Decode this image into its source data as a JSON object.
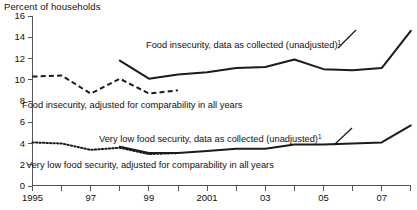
{
  "chart_data": {
    "type": "line",
    "title": "",
    "ylabel": "Percent of households",
    "xlabel": "",
    "ylim": [
      0,
      16
    ],
    "xlim": [
      1995,
      2008
    ],
    "y_ticks": [
      "0",
      "2",
      "4",
      "6",
      "8",
      "10",
      "12",
      "14",
      "16"
    ],
    "y_tick_values": [
      0,
      2,
      4,
      6,
      8,
      10,
      12,
      14,
      16
    ],
    "x_ticks": [
      1995,
      1996,
      1997,
      1998,
      1999,
      2000,
      2001,
      2002,
      2003,
      2004,
      2005,
      2006,
      2007,
      2008
    ],
    "x_tick_labels": [
      "1995",
      "",
      "97",
      "",
      "99",
      "",
      "2001",
      "",
      "03",
      "",
      "05",
      "",
      "07",
      ""
    ],
    "grid": false,
    "legend_position": "inline-annotations",
    "series": [
      {
        "name": "Food insecurity, data as collected (unadjusted)",
        "style": "solid",
        "x": [
          1998,
          1999,
          2000,
          2001,
          2002,
          2003,
          2004,
          2005,
          2006,
          2007,
          2008
        ],
        "values": [
          11.8,
          10.1,
          10.5,
          10.7,
          11.1,
          11.2,
          11.9,
          11.0,
          10.9,
          11.1,
          14.6
        ]
      },
      {
        "name": "Food insecurity, adjusted for comparability in all years",
        "style": "dashed",
        "x": [
          1995,
          1996,
          1997,
          1998,
          1999,
          2000
        ],
        "values": [
          10.3,
          10.4,
          8.7,
          10.1,
          8.7,
          9.0
        ]
      },
      {
        "name": "Very low food security, data as collected (unadjusted)",
        "style": "solid",
        "x": [
          1998,
          1999,
          2000,
          2001,
          2002,
          2003,
          2004,
          2005,
          2006,
          2007,
          2008
        ],
        "values": [
          3.7,
          3.1,
          3.1,
          3.3,
          3.5,
          3.5,
          3.9,
          3.9,
          4.0,
          4.1,
          5.7
        ]
      },
      {
        "name": "Very low food security, adjusted for comparability in all years",
        "style": "dotted",
        "x": [
          1995,
          1996,
          1997,
          1998,
          1999,
          2000
        ],
        "values": [
          4.1,
          4.0,
          3.4,
          3.6,
          3.0,
          3.1
        ]
      }
    ],
    "annotations": [
      {
        "id": "ann-food-insecurity-unadjusted",
        "text": "Food insecurity, data as collected (unadjusted)",
        "superscript": "1"
      },
      {
        "id": "ann-food-insecurity-adjusted",
        "text": "Food insecurity, adjusted for comparability in all years",
        "superscript": ""
      },
      {
        "id": "ann-very-low-unadjusted",
        "text": "Very low food security, data as collected (unadjusted)",
        "superscript": "1"
      },
      {
        "id": "ann-very-low-adjusted",
        "text": "Very low food security, adjusted for comparability in all years",
        "superscript": ""
      }
    ],
    "colors": {
      "line": "#1b1b1b",
      "axis": "#555555",
      "background": "#ffffff"
    }
  }
}
